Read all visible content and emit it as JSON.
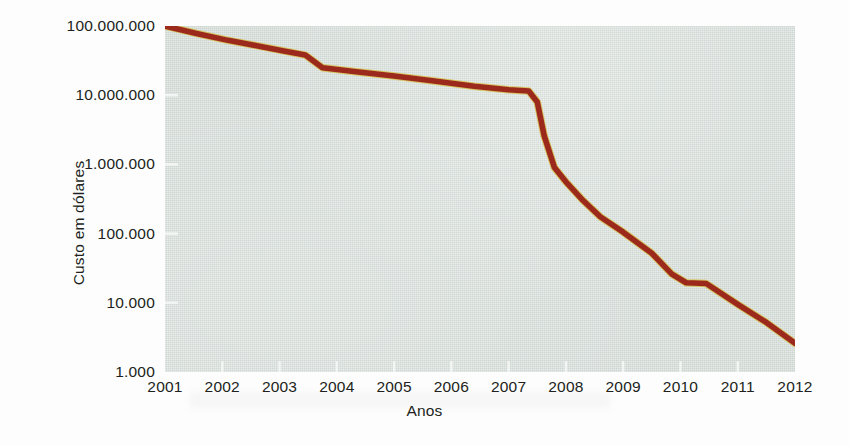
{
  "chart_data": {
    "type": "line",
    "title": "",
    "xlabel": "Anos",
    "ylabel": "Custo em dólares",
    "grid": false,
    "legend": false,
    "yscale": "log",
    "ylim": [
      1000,
      100000000
    ],
    "xlim": [
      2001,
      2012
    ],
    "y_tick_labels": [
      "100.000.000",
      "10.000.000",
      "1.000.000",
      "100.000",
      "10.000",
      "1.000"
    ],
    "y_tick_values": [
      100000000,
      10000000,
      1000000,
      100000,
      10000,
      1000
    ],
    "x_tick_labels": [
      "2001",
      "2002",
      "2003",
      "2004",
      "2005",
      "2006",
      "2007",
      "2008",
      "2009",
      "2010",
      "2011",
      "2012"
    ],
    "x_tick_values": [
      2001,
      2002,
      2003,
      2004,
      2005,
      2006,
      2007,
      2008,
      2009,
      2010,
      2011,
      2012
    ],
    "series": [
      {
        "name": "Custo do sequenciamento de um genoma humano",
        "color": "#9c2a1c",
        "x": [
          2001,
          2001.55,
          2002.1,
          2002.6,
          2003.05,
          2003.45,
          2003.75,
          2004.3,
          2005.0,
          2005.7,
          2006.4,
          2007.0,
          2007.35,
          2007.5,
          2007.62,
          2007.8,
          2008.0,
          2008.3,
          2008.6,
          2009.0,
          2009.5,
          2009.85,
          2010.1,
          2010.45,
          2011.0,
          2011.5,
          2012.0
        ],
        "y": [
          100000000,
          78000000,
          62000000,
          52000000,
          44000000,
          38000000,
          25000000,
          22000000,
          19000000,
          16000000,
          13500000,
          12000000,
          11500000,
          8000000,
          2600000,
          900000,
          560000,
          300000,
          175000,
          105000,
          52000,
          26000,
          19500,
          19000,
          9500,
          5200,
          2600
        ]
      }
    ]
  },
  "axes": {
    "x_axis_label": "Anos",
    "y_axis_label": "Custo em dólares"
  },
  "colors": {
    "line": "#9c2a1c",
    "line_highlight": "#d4b93a",
    "plot_background": "#ccd5d0",
    "page_background": "#fdfdfd",
    "text": "#211f20",
    "tick_mark": "#f2f5f3"
  }
}
